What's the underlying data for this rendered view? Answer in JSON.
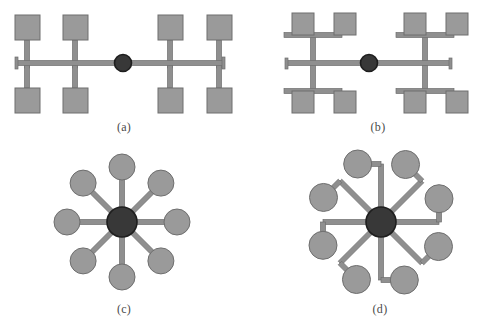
{
  "figure": {
    "background_color": "#ffffff",
    "panel_count": 4,
    "node_fill_color": "#9a9a9a",
    "node_stroke_color": "#6e6e6e",
    "hub_fill_color": "#383838",
    "hub_stroke_color": "#1e1e1e",
    "link_color": "#8f8f8f",
    "link_stroke_color": "#6e6e6e",
    "caption_color": "#4a4a4a"
  },
  "panels": [
    {
      "id": "panel-a",
      "caption": "(a)",
      "topology_type": "bus",
      "node_shape": "square",
      "hub_shape": "circle",
      "leaf_count": 8,
      "caption_x": 124,
      "caption_y": 128
    },
    {
      "id": "panel-b",
      "caption": "(b)",
      "topology_type": "tree",
      "node_shape": "square",
      "hub_shape": "circle",
      "leaf_count": 8,
      "caption_x": 378,
      "caption_y": 128
    },
    {
      "id": "panel-c",
      "caption": "(c)",
      "topology_type": "star",
      "node_shape": "circle",
      "hub_shape": "circle",
      "leaf_count": 8,
      "caption_x": 124,
      "caption_y": 310
    },
    {
      "id": "panel-d",
      "caption": "(d)",
      "topology_type": "star-offset-stub",
      "node_shape": "circle",
      "hub_shape": "circle",
      "leaf_count": 8,
      "caption_x": 380,
      "caption_y": 310
    }
  ],
  "geometry": {
    "panel_a": {
      "bus": {
        "x1": 16,
        "y1": 63,
        "x2": 224,
        "y2": 63,
        "thickness": 5
      },
      "hub": {
        "cx": 123,
        "cy": 63,
        "r": 8.5
      },
      "risers_x": [
        27,
        75,
        170,
        219
      ],
      "riser_top_y": 40,
      "riser_bottom_y": 88,
      "square_size": 25,
      "squares_top_y": 15,
      "squares_bottom_y": 88,
      "squares_x": [
        15,
        63,
        158,
        207
      ]
    },
    "panel_b": {
      "bus": {
        "x1": 286,
        "y1": 63,
        "x2": 451,
        "y2": 63,
        "thickness": 5
      },
      "hub": {
        "cx": 369,
        "cy": 63,
        "r": 8.5
      },
      "trunks_x": [
        313,
        425
      ],
      "trunk_top_y": 35,
      "trunk_bottom_y": 91,
      "branch_half_width": 29,
      "square_size": 22,
      "squares_top_y": 13,
      "squares_bottom_y": 91,
      "squares_x": [
        292,
        334,
        404,
        446
      ]
    },
    "panel_c": {
      "hub": {
        "cx": 122,
        "cy": 222,
        "r": 15
      },
      "leaf_radius": 13,
      "spoke_length": 55,
      "spoke_thickness": 5,
      "angles_deg": [
        270,
        315,
        0,
        45,
        90,
        135,
        180,
        225
      ]
    },
    "panel_d": {
      "hub": {
        "cx": 381,
        "cy": 222,
        "r": 15
      },
      "leaf_radius": 14,
      "spoke_length": 58,
      "stub_length": 17,
      "spoke_thickness": 5,
      "angles_deg": [
        270,
        315,
        0,
        45,
        90,
        135,
        180,
        225
      ]
    }
  }
}
